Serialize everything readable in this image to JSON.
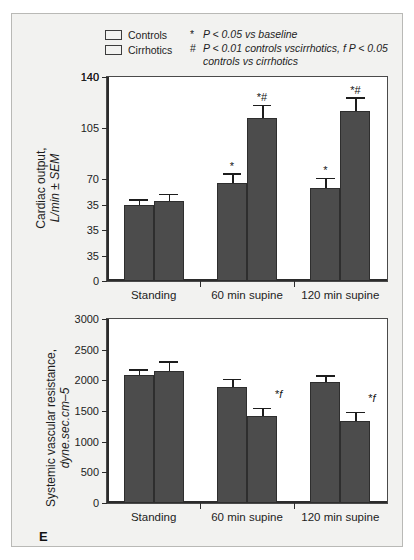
{
  "figure": {
    "panel_label": "E"
  },
  "legend": {
    "series": [
      {
        "label": "Controls",
        "color": "#4c4c4c"
      },
      {
        "label": "Cirrhotics",
        "color": "#4c4c4c"
      }
    ],
    "notes": [
      {
        "symbol": "*",
        "text": "P < 0.05 vs baseline"
      },
      {
        "symbol": "#",
        "text": "P < 0.01 controls vscirrhotics, f P < 0.05"
      },
      {
        "symbol": "",
        "text": "controls vs cirrhotics"
      }
    ]
  },
  "chart_data": [
    {
      "type": "bar",
      "title": "",
      "ylabel": "Cardiac output, L/min ± SEM",
      "ylabel_line1": "Cardiac output,",
      "ylabel_line2": "L/min ± SEM",
      "xlabel": "",
      "categories": [
        "Standing",
        "60 min supine",
        "120 min supine"
      ],
      "ytick_labels": [
        "0",
        "35",
        "35",
        "35",
        "70",
        "105",
        "140",
        "140"
      ],
      "ytick_values": [
        0,
        17.5,
        35,
        52.5,
        70,
        105,
        140,
        140
      ],
      "ylim": [
        0,
        140
      ],
      "grid": false,
      "legend_position": "top",
      "series": [
        {
          "name": "Controls",
          "values": [
            52,
            67,
            64
          ],
          "errors": [
            3,
            6,
            6
          ],
          "annotations": [
            "",
            "*",
            "*"
          ]
        },
        {
          "name": "Cirrhotics",
          "values": [
            55,
            112,
            117
          ],
          "errors": [
            4,
            8,
            8
          ],
          "annotations": [
            "",
            "*#",
            "*#"
          ]
        }
      ]
    },
    {
      "type": "bar",
      "title": "",
      "ylabel": "Systemic vascular resistance, dyne.sec.cm–5",
      "ylabel_line1": "Systemic vascular resistance,",
      "ylabel_line2": "dyne.sec.cm–5",
      "xlabel": "",
      "categories": [
        "Standing",
        "60 min supine",
        "120 min supine"
      ],
      "ytick_labels": [
        "0",
        "500",
        "1000",
        "1500",
        "2000",
        "2500",
        "3000"
      ],
      "ytick_values": [
        0,
        500,
        1000,
        1500,
        2000,
        2500,
        3000
      ],
      "ylim": [
        0,
        3000
      ],
      "grid": false,
      "legend_position": "none",
      "series": [
        {
          "name": "Controls",
          "values": [
            2090,
            1890,
            1970
          ],
          "errors": [
            70,
            110,
            90
          ],
          "annotations": [
            "",
            "",
            ""
          ]
        },
        {
          "name": "Cirrhotics",
          "values": [
            2150,
            1420,
            1340
          ],
          "errors": [
            140,
            110,
            120
          ],
          "annotations": [
            "",
            "*f",
            "*f"
          ]
        }
      ]
    }
  ]
}
